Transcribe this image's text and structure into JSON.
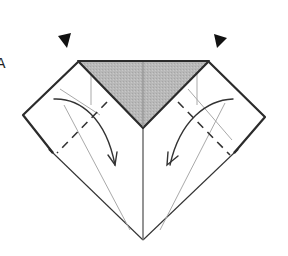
{
  "diagram": {
    "title": "",
    "colors": {
      "background": "#ffffff",
      "paper_shade": "#b8b8b8",
      "line": "#2b2b2b",
      "guide_line": "#a9a9a9"
    },
    "icons": {
      "left_pointer": "black-triangle-pointer",
      "right_pointer": "black-triangle-pointer",
      "left_fold_arrow": "curved-fold-arrow",
      "right_fold_arrow": "curved-fold-arrow"
    },
    "edge_glyph": "A"
  }
}
